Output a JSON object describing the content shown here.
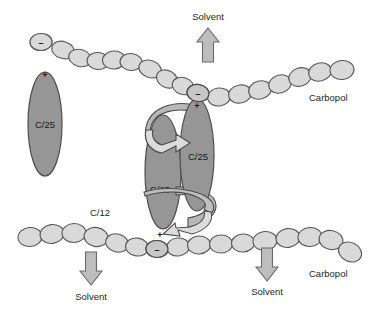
{
  "figure": {
    "background": "#ffffff"
  },
  "colors": {
    "bead_fill": "#d9d9d9",
    "bead_stroke": "#5a5a5a",
    "micelle_fill": "#969696",
    "micelle_stroke": "#4d4d4d",
    "ribbon_fill": "#d5d5d5",
    "ribbon_stroke": "#4d4d4d",
    "arrow_fill": "#bdbdbd",
    "arrow_stroke": "#6b6b6b",
    "text": "#231f20"
  },
  "labels": {
    "solvent_top": "Solvent",
    "solvent_bottom_left": "Solvent",
    "solvent_bottom_right": "Solvent",
    "carbopol_right": "Carbopol",
    "carbopol_bottom_right": "Carbopol",
    "c12": "C/12",
    "c25_left": "C/25",
    "c25_center_left": "C/25",
    "c25_center_right": "C/25"
  },
  "charges": {
    "top_left_minus": "–",
    "top_left_plus": "+",
    "top_center_minus": "–",
    "top_center_plus": "+",
    "bottom_center_plus": "+",
    "bottom_center_minus": "–"
  },
  "molecules": [
    {
      "name": "c25-left",
      "label": "C/25",
      "cx": 45,
      "cy": 124,
      "rx": 17,
      "ry": 52,
      "head_charge": "+",
      "bound_bead_charge": "–"
    },
    {
      "name": "c25-center-right",
      "label": "C/25",
      "cx": 197,
      "cy": 155,
      "rx": 17,
      "ry": 56,
      "head_charge": "+",
      "bound_bead_charge": "–"
    },
    {
      "name": "c25-center-left",
      "label": "C/25",
      "cx": 163,
      "cy": 172,
      "rx": 18,
      "ry": 57,
      "head_charge": "+",
      "bound_bead_charge": "–"
    }
  ],
  "arrows": [
    {
      "name": "solvent-arrow-top",
      "direction": "up",
      "x": 208,
      "y": 30,
      "label": "Solvent"
    },
    {
      "name": "solvent-arrow-bottom-left",
      "direction": "down",
      "x": 91,
      "y": 262,
      "label": "Solvent"
    },
    {
      "name": "solvent-arrow-bottom-right",
      "direction": "down",
      "x": 267,
      "y": 258,
      "label": "Solvent"
    }
  ],
  "chains": [
    {
      "name": "carbopol-chain-top",
      "label": "Carbopol",
      "bead_count": 17
    },
    {
      "name": "carbopol-chain-bottom",
      "label": "Carbopol",
      "bead_count": 18
    }
  ]
}
